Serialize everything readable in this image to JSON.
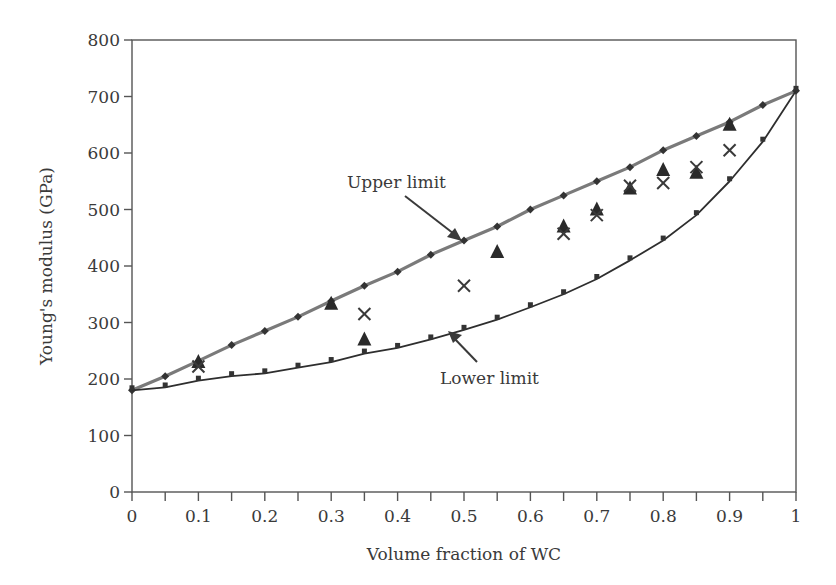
{
  "chart_data": {
    "type": "line",
    "title": "",
    "xlabel": "Volume fraction of WC",
    "ylabel": "Young's modulus (GPa)",
    "xlim": [
      0,
      1
    ],
    "ylim": [
      0,
      800
    ],
    "x_ticks": [
      "0",
      "0.1",
      "0.2",
      "0.3",
      "0.4",
      "0.5",
      "0.6",
      "0.7",
      "0.8",
      "0.9",
      "1"
    ],
    "x_tick_values": [
      0,
      0.1,
      0.2,
      0.3,
      0.4,
      0.5,
      0.6,
      0.7,
      0.8,
      0.9,
      1.0
    ],
    "x_minor_tick_step": 0.05,
    "y_ticks": [
      "0",
      "100",
      "200",
      "300",
      "400",
      "500",
      "600",
      "700",
      "800"
    ],
    "y_tick_values": [
      0,
      100,
      200,
      300,
      400,
      500,
      600,
      700,
      800
    ],
    "grid": false,
    "legend": "none",
    "series": [
      {
        "name": "Upper limit",
        "style": "line-diamond",
        "color": "#7a7a7a",
        "x": [
          0,
          0.05,
          0.1,
          0.15,
          0.2,
          0.25,
          0.3,
          0.35,
          0.4,
          0.45,
          0.5,
          0.55,
          0.6,
          0.65,
          0.7,
          0.75,
          0.8,
          0.85,
          0.9,
          0.95,
          1.0
        ],
        "values": [
          180,
          205,
          232,
          260,
          285,
          310,
          338,
          365,
          390,
          420,
          445,
          470,
          500,
          525,
          550,
          575,
          605,
          630,
          655,
          685,
          710
        ]
      },
      {
        "name": "Lower limit",
        "style": "line-square",
        "color": "#2e2e2e",
        "x": [
          0,
          0.05,
          0.1,
          0.15,
          0.2,
          0.25,
          0.3,
          0.35,
          0.4,
          0.45,
          0.5,
          0.55,
          0.6,
          0.65,
          0.7,
          0.75,
          0.8,
          0.85,
          0.9,
          0.95,
          1.0
        ],
        "values": [
          180,
          185,
          197,
          205,
          210,
          220,
          230,
          245,
          255,
          270,
          287,
          305,
          327,
          350,
          377,
          410,
          445,
          490,
          550,
          620,
          710
        ]
      },
      {
        "name": "Experimental (triangle)",
        "style": "marker-triangle",
        "color": "#2a2a2a",
        "x": [
          0.1,
          0.3,
          0.35,
          0.55,
          0.65,
          0.7,
          0.75,
          0.8,
          0.85,
          0.9
        ],
        "values": [
          230,
          333,
          270,
          425,
          470,
          500,
          537,
          570,
          565,
          650
        ]
      },
      {
        "name": "Experimental (cross)",
        "style": "marker-x",
        "color": "#3a3a3a",
        "x": [
          0.1,
          0.35,
          0.5,
          0.65,
          0.7,
          0.75,
          0.8,
          0.85,
          0.9
        ],
        "values": [
          222,
          315,
          365,
          457,
          490,
          542,
          547,
          575,
          605
        ]
      }
    ],
    "annotations": [
      {
        "text": "Upper limit",
        "points_to": {
          "x": 0.48,
          "y": 440
        }
      },
      {
        "text": "Lower limit",
        "points_to": {
          "x": 0.48,
          "y": 280
        }
      }
    ]
  },
  "labels": {
    "xlabel": "Volume fraction of WC",
    "ylabel": "Young's modulus (GPa)",
    "upper_annotation": "Upper limit",
    "lower_annotation": "Lower limit"
  }
}
